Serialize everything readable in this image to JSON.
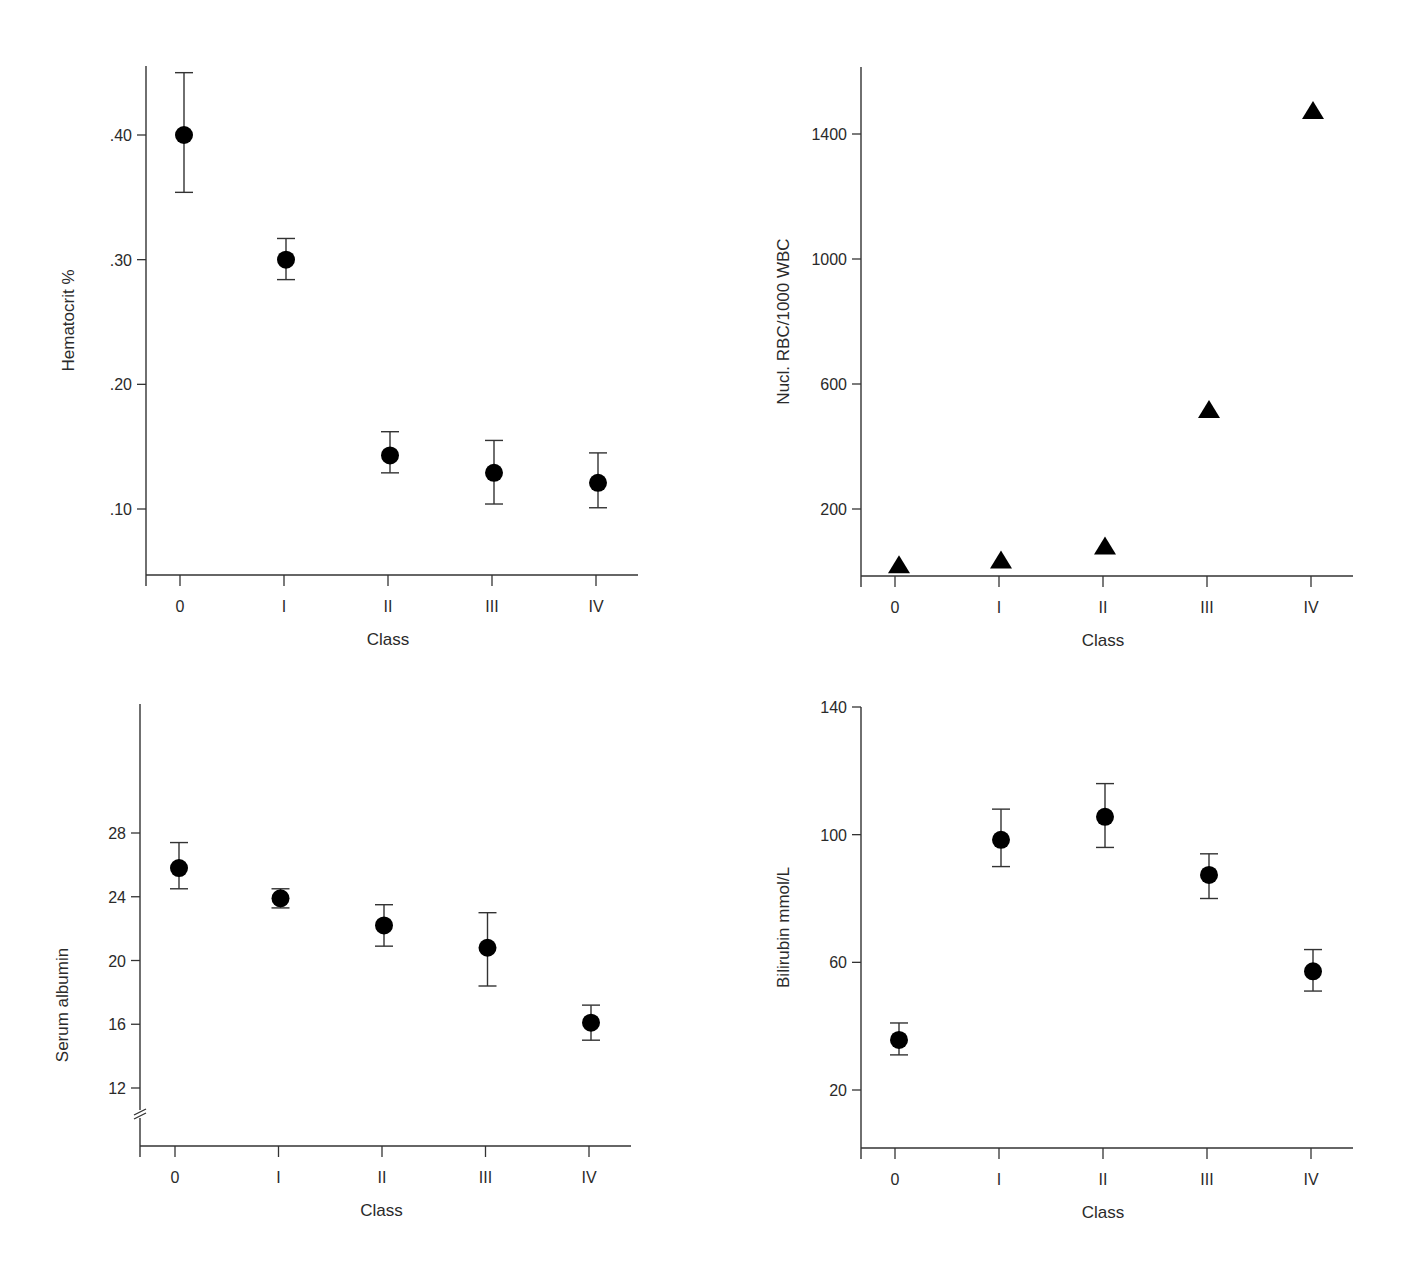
{
  "figure": {
    "panels_count": 4
  },
  "chart_data": [
    {
      "id": "hematocrit",
      "type": "scatter",
      "marker": "circle",
      "title": "",
      "xlabel": "Class",
      "ylabel": "Hematocrit %",
      "categories": [
        "0",
        "I",
        "II",
        "III",
        "IV"
      ],
      "yticks": [
        0.1,
        0.2,
        0.3,
        0.4
      ],
      "ytick_labels": [
        ".10",
        ".20",
        ".30",
        ".40"
      ],
      "ylim": [
        0.048,
        0.455
      ],
      "axis_break": false,
      "grid": false,
      "values": [
        0.4,
        0.3,
        0.143,
        0.129,
        0.121
      ],
      "error_upper": [
        0.45,
        0.317,
        0.162,
        0.155,
        0.145
      ],
      "error_lower": [
        0.354,
        0.284,
        0.129,
        0.104,
        0.101
      ],
      "box": {
        "x0": 146,
        "y_top": 66,
        "x1": 638,
        "y_axis": 575,
        "x_first": 180,
        "x_step": 104,
        "y_ref_px": [
          509,
          135
        ],
        "y_ref_val": [
          0.1,
          0.4
        ]
      }
    },
    {
      "id": "nucleated_rbc",
      "type": "scatter",
      "marker": "triangle",
      "title": "",
      "xlabel": "Class",
      "ylabel": "Nucl. RBC/1000 WBC",
      "categories": [
        "0",
        "I",
        "II",
        "III",
        "IV"
      ],
      "yticks": [
        200,
        600,
        1000,
        1400
      ],
      "ytick_labels": [
        "200",
        "600",
        "1000",
        "1400"
      ],
      "ylim": [
        -15,
        1610
      ],
      "axis_break": false,
      "grid": false,
      "values": [
        20,
        35,
        80,
        517,
        1474
      ],
      "error_upper": null,
      "error_lower": null,
      "box": {
        "x0": 861,
        "y_top": 67,
        "x1": 1353,
        "y_axis": 576,
        "x_first": 895,
        "x_step": 104,
        "y_ref_px": [
          509,
          134
        ],
        "y_ref_val": [
          200,
          1400
        ]
      }
    },
    {
      "id": "serum_albumin",
      "type": "scatter",
      "marker": "circle",
      "title": "",
      "xlabel": "Class",
      "ylabel": "Serum albumin",
      "categories": [
        "0",
        "I",
        "II",
        "III",
        "IV"
      ],
      "yticks": [
        12,
        16,
        20,
        24,
        28
      ],
      "ytick_labels": [
        "12",
        "16",
        "20",
        "24",
        "28"
      ],
      "ylim": [
        8.5,
        36.1
      ],
      "axis_break": true,
      "grid": false,
      "values": [
        25.8,
        23.9,
        22.2,
        20.8,
        16.1
      ],
      "error_upper": [
        27.4,
        24.5,
        23.5,
        23.0,
        17.2
      ],
      "error_lower": [
        24.5,
        23.3,
        20.9,
        18.4,
        15.0
      ],
      "box": {
        "x0": 140,
        "y_top": 704,
        "x1": 631,
        "y_axis": 1146,
        "x_first": 175,
        "x_step": 103.5,
        "y_ref_px": [
          1088,
          833
        ],
        "y_ref_val": [
          12,
          28
        ],
        "break_y": 1115
      }
    },
    {
      "id": "bilirubin",
      "type": "scatter",
      "marker": "circle",
      "title": "",
      "xlabel": "Class",
      "ylabel": "Bilirubin mmol/L",
      "categories": [
        "0",
        "I",
        "II",
        "III",
        "IV"
      ],
      "yticks": [
        20,
        60,
        100,
        140
      ],
      "ytick_labels": [
        "20",
        "60",
        "100",
        "140"
      ],
      "ylim": [
        1.8,
        140
      ],
      "axis_break": false,
      "grid": false,
      "values": [
        35.7,
        98.4,
        105.6,
        87.4,
        57.2
      ],
      "error_upper": [
        41,
        108,
        116,
        94,
        64
      ],
      "error_lower": [
        31,
        90,
        96,
        80,
        51
      ],
      "box": {
        "x0": 861,
        "y_top": 707,
        "x1": 1353,
        "y_axis": 1148,
        "x_first": 895,
        "x_step": 104,
        "y_ref_px": [
          1090,
          707
        ],
        "y_ref_val": [
          20,
          140
        ]
      }
    }
  ]
}
